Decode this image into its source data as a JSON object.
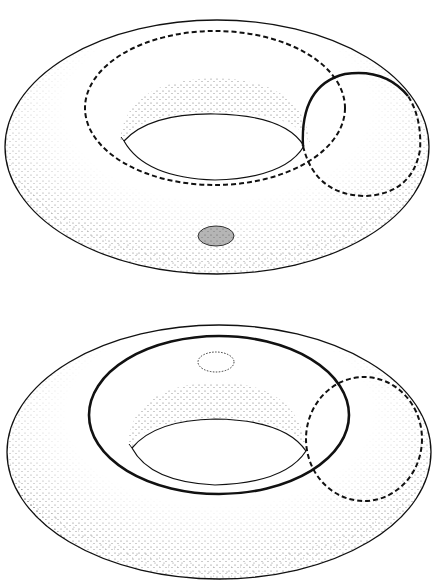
{
  "diagram": {
    "type": "torus-curves-illustration",
    "figures": [
      {
        "id": "top",
        "description": "Torus with dashed longitude curve, meridian circle (solid front half, dashed back half), and shaded small disk on the outer surface",
        "elements": {
          "outer_outline": "solid",
          "hole_outline": "solid",
          "longitude_curve": "dashed",
          "meridian_front": "solid",
          "meridian_back": "dashed",
          "small_disk": "shaded-filled"
        }
      },
      {
        "id": "bottom",
        "description": "Torus with solid longitude curve, dashed meridian circle, and dotted small disk on the hidden side",
        "elements": {
          "outer_outline": "solid",
          "hole_outline": "solid",
          "longitude_curve": "solid-bold",
          "meridian": "dashed",
          "small_disk": "dotted-outline"
        }
      }
    ],
    "colors": {
      "line": "#111111",
      "stipple": "#555555",
      "disk_fill": "#b8b8b8",
      "background": "#ffffff"
    }
  }
}
